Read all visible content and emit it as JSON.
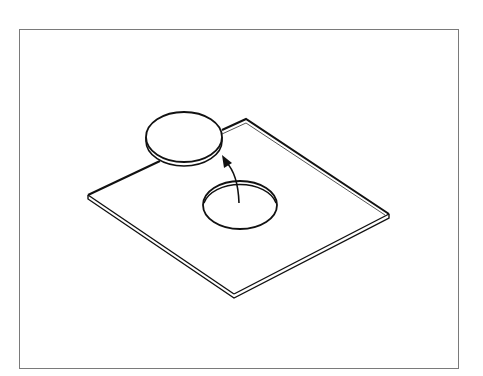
{
  "diagram": {
    "frame": {
      "x": 19,
      "y": 29,
      "width": 439,
      "height": 339,
      "stroke": "#7a7a7a"
    },
    "colors": {
      "line": "#111111",
      "background": "#ffffff"
    },
    "plate": {
      "corners": {
        "left": [
          88,
          195
        ],
        "back": [
          246,
          119
        ],
        "right": [
          389,
          214
        ],
        "front": [
          234,
          294
        ]
      },
      "thickness": 4
    },
    "disc": {
      "cx": 184,
      "cy": 137,
      "rx": 38,
      "ry": 25,
      "thickness": 4
    },
    "hole": {
      "cx": 240,
      "cy": 205,
      "rx": 37,
      "ry": 24
    },
    "arrow": {
      "from": [
        239,
        203
      ],
      "to": [
        223,
        156
      ],
      "label": ""
    }
  }
}
